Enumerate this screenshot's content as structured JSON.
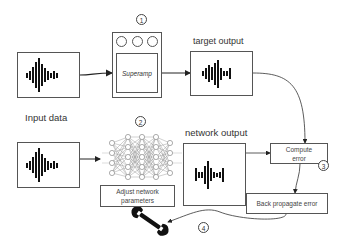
{
  "diagram": {
    "steps": [
      {
        "id": "1",
        "label": "1"
      },
      {
        "id": "2",
        "label": "2"
      },
      {
        "id": "3",
        "label": "3"
      },
      {
        "id": "4",
        "label": "4"
      }
    ],
    "labels": {
      "target_output": "target output",
      "input_data": "Input data",
      "network_output": "network output"
    },
    "pedal": {
      "name": "Superamp",
      "knobs": 3
    },
    "boxes": {
      "compute_error_line1": "Compute",
      "compute_error_line2": "error",
      "adjust_params_line1": "Adjust network",
      "adjust_params_line2": "parameters",
      "back_propagate": "Back propagate error"
    },
    "icons": {
      "waveform": "audio-waveform-icon",
      "neural_network": "neural-network-icon",
      "wrench": "wrench-icon"
    },
    "colors": {
      "stroke": "#555555",
      "fill": "#111111",
      "background": "#ffffff"
    }
  }
}
